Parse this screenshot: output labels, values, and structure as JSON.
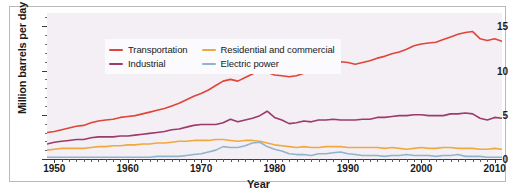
{
  "chart_data": {
    "type": "line",
    "title": "",
    "xlabel": "Year",
    "ylabel": "Million barrels per day",
    "xlim": [
      1949,
      2011
    ],
    "ylim": [
      0,
      16.5
    ],
    "xticks": [
      1950,
      1960,
      1970,
      1980,
      1990,
      2000,
      2010
    ],
    "xtick_labels": [
      "1950",
      "1960",
      "1970",
      "1980",
      "1990",
      "2000",
      "2010"
    ],
    "yticks": [
      0,
      5,
      10,
      15
    ],
    "ytick_labels": [
      "0",
      "5",
      "10",
      "15"
    ],
    "grid": false,
    "legend_position": "upper-left-inside",
    "plot_background": "#f3eff5",
    "x": [
      1949,
      1950,
      1951,
      1952,
      1953,
      1954,
      1955,
      1956,
      1957,
      1958,
      1959,
      1960,
      1961,
      1962,
      1963,
      1964,
      1965,
      1966,
      1967,
      1968,
      1969,
      1970,
      1971,
      1972,
      1973,
      1974,
      1975,
      1976,
      1977,
      1978,
      1979,
      1980,
      1981,
      1982,
      1983,
      1984,
      1985,
      1986,
      1987,
      1988,
      1989,
      1990,
      1991,
      1992,
      1993,
      1994,
      1995,
      1996,
      1997,
      1998,
      1999,
      2000,
      2001,
      2002,
      2003,
      2004,
      2005,
      2006,
      2007,
      2008,
      2009,
      2010,
      2011
    ],
    "series": [
      {
        "name": "Transportation",
        "color": "#e0453a",
        "values": [
          3.0,
          3.1,
          3.3,
          3.5,
          3.7,
          3.8,
          4.1,
          4.3,
          4.4,
          4.5,
          4.7,
          4.8,
          4.9,
          5.1,
          5.3,
          5.5,
          5.7,
          6.0,
          6.3,
          6.7,
          7.1,
          7.4,
          7.8,
          8.3,
          8.8,
          9.0,
          8.8,
          9.2,
          9.6,
          10.1,
          9.8,
          9.5,
          9.4,
          9.3,
          9.4,
          9.7,
          9.9,
          10.2,
          10.5,
          10.8,
          11.0,
          10.9,
          10.7,
          10.9,
          11.1,
          11.4,
          11.6,
          11.9,
          12.1,
          12.4,
          12.8,
          13.0,
          13.1,
          13.2,
          13.5,
          13.8,
          14.1,
          14.3,
          14.4,
          13.6,
          13.4,
          13.6,
          13.3
        ]
      },
      {
        "name": "Industrial",
        "color": "#9c3a6b",
        "values": [
          1.7,
          1.9,
          2.0,
          2.1,
          2.2,
          2.2,
          2.4,
          2.5,
          2.5,
          2.5,
          2.6,
          2.6,
          2.7,
          2.8,
          2.9,
          3.0,
          3.1,
          3.3,
          3.4,
          3.6,
          3.8,
          3.9,
          3.9,
          3.9,
          4.1,
          4.5,
          4.2,
          4.4,
          4.6,
          4.9,
          5.4,
          4.7,
          4.4,
          4.0,
          4.1,
          4.3,
          4.2,
          4.4,
          4.4,
          4.5,
          4.4,
          4.4,
          4.4,
          4.5,
          4.5,
          4.7,
          4.7,
          4.8,
          4.9,
          4.9,
          5.0,
          5.0,
          4.9,
          4.9,
          4.9,
          5.1,
          5.1,
          5.2,
          5.1,
          4.6,
          4.4,
          4.7,
          4.6
        ]
      },
      {
        "name": "Residential and commercial",
        "color": "#f0a93c",
        "values": [
          1.0,
          1.1,
          1.2,
          1.2,
          1.2,
          1.2,
          1.3,
          1.4,
          1.4,
          1.5,
          1.5,
          1.6,
          1.6,
          1.7,
          1.7,
          1.8,
          1.8,
          1.9,
          2.0,
          2.0,
          2.1,
          2.1,
          2.1,
          2.2,
          2.2,
          2.1,
          2.0,
          2.1,
          2.1,
          2.0,
          1.8,
          1.6,
          1.5,
          1.4,
          1.3,
          1.4,
          1.3,
          1.3,
          1.4,
          1.4,
          1.4,
          1.3,
          1.3,
          1.3,
          1.3,
          1.3,
          1.2,
          1.3,
          1.2,
          1.1,
          1.2,
          1.3,
          1.2,
          1.2,
          1.3,
          1.3,
          1.2,
          1.2,
          1.2,
          1.1,
          1.1,
          1.2,
          1.1
        ]
      },
      {
        "name": "Electric power",
        "color": "#8fb4cc",
        "values": [
          0.2,
          0.2,
          0.2,
          0.2,
          0.2,
          0.2,
          0.2,
          0.2,
          0.2,
          0.2,
          0.2,
          0.2,
          0.2,
          0.2,
          0.2,
          0.3,
          0.3,
          0.3,
          0.3,
          0.4,
          0.5,
          0.6,
          0.8,
          1.0,
          1.4,
          1.3,
          1.3,
          1.5,
          1.8,
          1.9,
          1.4,
          1.1,
          0.9,
          0.6,
          0.5,
          0.5,
          0.4,
          0.6,
          0.6,
          0.7,
          0.8,
          0.6,
          0.5,
          0.4,
          0.4,
          0.4,
          0.3,
          0.4,
          0.4,
          0.5,
          0.4,
          0.4,
          0.4,
          0.3,
          0.4,
          0.4,
          0.5,
          0.3,
          0.3,
          0.3,
          0.2,
          0.2,
          0.2
        ]
      }
    ]
  },
  "legend": {
    "items": [
      {
        "label": "Transportation",
        "color": "#e0453a"
      },
      {
        "label": "Residential and commercial",
        "color": "#f0a93c"
      },
      {
        "label": "Industrial",
        "color": "#9c3a6b"
      },
      {
        "label": "Electric power",
        "color": "#8fb4cc"
      }
    ]
  }
}
